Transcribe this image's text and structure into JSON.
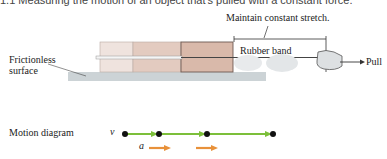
{
  "figure": {
    "caption_partial": "1.1 Measuring the motion of an object that's pulled with a constant force.",
    "annotation_stretch": "Maintain constant stretch.",
    "label_rubber_band": "Rubber band",
    "label_pull": "Pull",
    "label_surface_line1": "Frictionless",
    "label_surface_line2": "surface",
    "label_motion_diagram": "Motion diagram",
    "velocity_symbol": "v⃗",
    "acceleration_symbol": "a⃗",
    "colors": {
      "velocity": "#7cbf3a",
      "acceleration": "#e8913a",
      "block_light": "#ecdcd4",
      "block_dark": "#d8b8a8"
    }
  }
}
